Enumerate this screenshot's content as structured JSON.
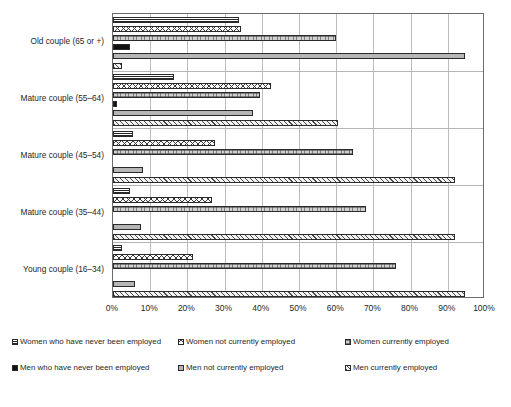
{
  "chart_data": {
    "type": "bar",
    "orientation": "horizontal",
    "title": "",
    "xlabel": "",
    "ylabel": "",
    "xlim": [
      0,
      100
    ],
    "xtick_labels": [
      "0%",
      "10%",
      "20%",
      "30%",
      "40%",
      "50%",
      "60%",
      "70%",
      "80%",
      "90%",
      "100%"
    ],
    "xtick_values": [
      0,
      10,
      20,
      30,
      40,
      50,
      60,
      70,
      80,
      90,
      100
    ],
    "grid": true,
    "legend_position": "bottom",
    "categories": [
      "Old couple (65 or +)",
      "Mature couple (55–64)",
      "Mature couple (45–54)",
      "Mature couple (35–44)",
      "Young couple (16–34)"
    ],
    "series": [
      {
        "name": "Women who have never been employed",
        "pattern": "horizontal-stripes",
        "values": [
          34.0,
          16.5,
          5.5,
          4.5,
          2.5
        ]
      },
      {
        "name": "Women not currently employed",
        "pattern": "cross-hatch",
        "values": [
          34.5,
          42.5,
          27.5,
          26.5,
          21.5
        ]
      },
      {
        "name": "Women currently employed",
        "pattern": "fine-dotted-grey",
        "values": [
          60.0,
          39.5,
          64.5,
          68.0,
          76.0
        ]
      },
      {
        "name": "Men who have never been employed",
        "pattern": "solid-black",
        "values": [
          4.5,
          1.0,
          0.0,
          0.0,
          0.0
        ]
      },
      {
        "name": "Men not currently employed",
        "pattern": "solid-grey",
        "values": [
          94.5,
          37.5,
          8.0,
          7.5,
          6.0
        ]
      },
      {
        "name": "Men currently employed",
        "pattern": "diagonal-hatch",
        "values": [
          2.5,
          60.5,
          92.0,
          92.0,
          94.5
        ]
      }
    ]
  },
  "legend": {
    "items": [
      {
        "label": "Women who have never been employed",
        "swatch": "horizontal-stripes-swatch"
      },
      {
        "label": "Women not currently employed",
        "swatch": "cross-hatch-swatch"
      },
      {
        "label": "Women currently employed",
        "swatch": "fine-dotted-grey-swatch"
      },
      {
        "label": "Men who have never been employed",
        "swatch": "solid-black-swatch"
      },
      {
        "label": "Men not currently employed",
        "swatch": "solid-grey-swatch"
      },
      {
        "label": "Men currently employed",
        "swatch": "diagonal-hatch-swatch"
      }
    ]
  },
  "colors": {
    "axis": "#6b6b6b",
    "grid": "#bdbdbd",
    "text": "#1f1f1f",
    "black_fill": "#111111",
    "grey_fill": "#b6b6b6"
  }
}
